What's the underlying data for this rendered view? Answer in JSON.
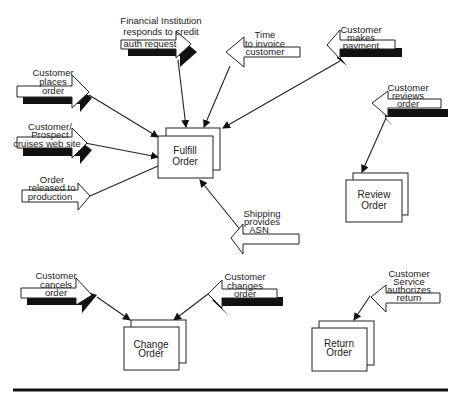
{
  "diagram": {
    "processes": [
      {
        "id": "fulfill",
        "lines": [
          "Fulfill",
          "Order"
        ]
      },
      {
        "id": "review",
        "lines": [
          "Review",
          "Order"
        ]
      },
      {
        "id": "change",
        "lines": [
          "Change",
          "Order"
        ]
      },
      {
        "id": "return",
        "lines": [
          "Return",
          "Order"
        ]
      }
    ],
    "events": [
      {
        "id": "fin",
        "target": "fulfill",
        "direction": "right",
        "shadow": true,
        "lines": [
          "Financial Institution",
          "responds to credit",
          "auth request"
        ]
      },
      {
        "id": "time",
        "target": "fulfill",
        "direction": "left",
        "shadow": false,
        "lines": [
          "Time",
          "to invoice",
          "customer"
        ]
      },
      {
        "id": "pay",
        "target": "fulfill",
        "direction": "left",
        "shadow": true,
        "lines": [
          "Customer",
          "makes",
          "payment"
        ]
      },
      {
        "id": "places",
        "target": "fulfill",
        "direction": "right",
        "shadow": true,
        "lines": [
          "Customer",
          "places",
          "order"
        ]
      },
      {
        "id": "cruises",
        "target": "fulfill",
        "direction": "right",
        "shadow": true,
        "lines": [
          "Customer/",
          "Prospect",
          "cruises web site"
        ]
      },
      {
        "id": "released",
        "target": "fulfill",
        "direction": "right",
        "shadow": false,
        "lines": [
          "Order",
          "released to",
          "production"
        ]
      },
      {
        "id": "ship",
        "target": "fulfill",
        "direction": "left",
        "shadow": false,
        "lines": [
          "Shipping",
          "provides",
          "ASN"
        ]
      },
      {
        "id": "reviews",
        "target": "review",
        "direction": "left",
        "shadow": true,
        "lines": [
          "Customer",
          "reviews",
          "order"
        ]
      },
      {
        "id": "cancels",
        "target": "change",
        "direction": "right",
        "shadow": true,
        "lines": [
          "Customer",
          "cancels",
          "order"
        ]
      },
      {
        "id": "changes",
        "target": "change",
        "direction": "left",
        "shadow": true,
        "lines": [
          "Customer",
          "changes",
          "order"
        ]
      },
      {
        "id": "authorizes",
        "target": "return",
        "direction": "left",
        "shadow": false,
        "lines": [
          "Customer",
          "Service",
          "authorizes",
          "return"
        ]
      }
    ]
  }
}
